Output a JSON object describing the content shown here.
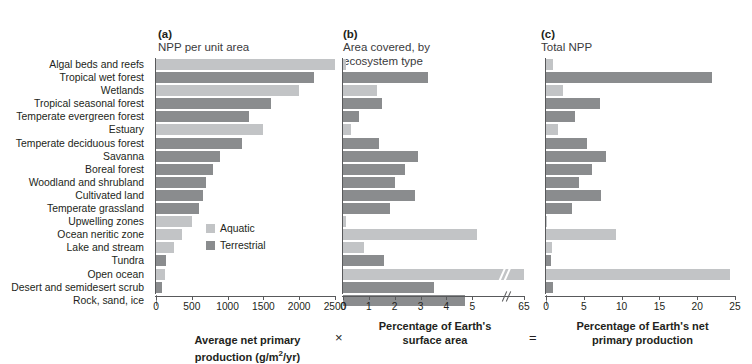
{
  "panels": {
    "a": {
      "tag": "(a)",
      "title": "NPP per unit area"
    },
    "b": {
      "tag": "(b)",
      "title": "Area covered, by\necosystem type"
    },
    "c": {
      "tag": "(c)",
      "title": "Total NPP"
    }
  },
  "operators": {
    "multiply": "×",
    "equals": "="
  },
  "legend": {
    "items": [
      {
        "label": "Aquatic",
        "color": "#c2c4c6",
        "key": "aquatic"
      },
      {
        "label": "Terrestrial",
        "color": "#8a8c8e",
        "key": "terrestrial"
      }
    ]
  },
  "captions": {
    "a": "Average net primary\nproduction (g/m²/yr)",
    "b": "Percentage of Earth's\nsurface area",
    "c": "Percentage of Earth's net\nprimary production"
  },
  "chart_data": {
    "type": "bar",
    "orientation": "horizontal",
    "grid": false,
    "legend_position": "inside-panel-a",
    "categories": [
      "Algal beds and reefs",
      "Tropical wet forest",
      "Wetlands",
      "Tropical seasonal forest",
      "Temperate evergreen forest",
      "Estuary",
      "Temperate deciduous forest",
      "Savanna",
      "Boreal forest",
      "Woodland and shrubland",
      "Cultivated land",
      "Temperate grassland",
      "Upwelling zones",
      "Ocean neritic zone",
      "Lake and stream",
      "Tundra",
      "Open ocean",
      "Desert and semidesert scrub",
      "Rock, sand, ice"
    ],
    "types": [
      "aquatic",
      "terrestrial",
      "aquatic",
      "terrestrial",
      "terrestrial",
      "aquatic",
      "terrestrial",
      "terrestrial",
      "terrestrial",
      "terrestrial",
      "terrestrial",
      "terrestrial",
      "aquatic",
      "aquatic",
      "aquatic",
      "terrestrial",
      "aquatic",
      "terrestrial",
      "terrestrial"
    ],
    "panels": [
      {
        "key": "a",
        "label": "(a) NPP per unit area",
        "xlabel": "Average net primary production (g/m2/yr)",
        "xlim": [
          0,
          2500
        ],
        "ticks": [
          0,
          500,
          1000,
          1500,
          2000,
          2500
        ],
        "values": [
          2500,
          2200,
          2000,
          1600,
          1300,
          1500,
          1200,
          900,
          800,
          700,
          650,
          600,
          500,
          360,
          250,
          140,
          125,
          90,
          3
        ]
      },
      {
        "key": "b",
        "label": "(b) Area covered, by ecosystem type",
        "xlabel": "Percentage of Earth's surface area",
        "xlim": [
          0,
          6
        ],
        "ticks": [
          0,
          1,
          2,
          3,
          4,
          5,
          6
        ],
        "axis_break": {
          "after": 6,
          "label": "65"
        },
        "values": [
          0.1,
          3.3,
          1.3,
          1.5,
          0.6,
          0.3,
          1.4,
          2.9,
          2.4,
          2.0,
          2.8,
          1.8,
          0.1,
          5.2,
          0.8,
          1.6,
          65.1,
          3.5,
          4.7
        ],
        "broken_bar_index": 16
      },
      {
        "key": "c",
        "label": "(c) Total NPP",
        "xlabel": "Percentage of Earth's net primary production",
        "xlim": [
          0,
          25
        ],
        "ticks": [
          0,
          5,
          10,
          15,
          20,
          25
        ],
        "values": [
          0.9,
          22.0,
          2.3,
          7.1,
          3.8,
          1.6,
          5.4,
          7.9,
          6.1,
          4.4,
          7.3,
          3.4,
          0.1,
          9.3,
          0.8,
          0.6,
          24.4,
          0.9,
          0.1
        ]
      }
    ]
  }
}
